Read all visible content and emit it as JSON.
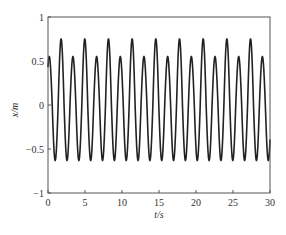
{
  "chart_data": {
    "type": "line",
    "title": "",
    "xlabel": "t/s",
    "ylabel": "x/m",
    "xlim": [
      0,
      30
    ],
    "ylim": [
      -1,
      1
    ],
    "xticks": [
      0,
      5,
      10,
      15,
      20,
      25,
      30
    ],
    "yticks": [
      -1,
      -0.5,
      0,
      0.5,
      1
    ],
    "xtick_labels": [
      "0",
      "5",
      "10",
      "15",
      "20",
      "25",
      "30"
    ],
    "ytick_labels": [
      "-1",
      "-0.5",
      "0",
      "0.5",
      "1"
    ],
    "grid": false,
    "legend": null,
    "series": [
      {
        "name": "x(t)",
        "color": "#222222",
        "description": "Oscillation with period ~1.6 s; peaks alternate between ~0.55 and ~0.75, troughs ~-0.63",
        "period_s": 1.6,
        "peak_high": 0.75,
        "peak_low": 0.55,
        "trough": -0.63
      }
    ]
  },
  "axes": {
    "xlabel": "t/s",
    "ylabel": "x/m"
  }
}
